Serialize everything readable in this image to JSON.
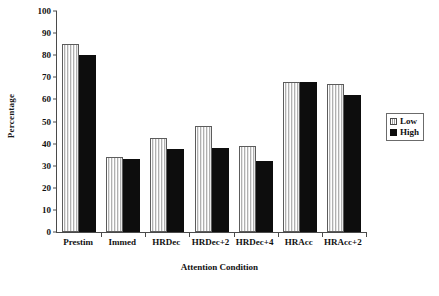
{
  "chart_data": {
    "type": "bar",
    "title": "",
    "xlabel": "Attention Condition",
    "ylabel": "Percentage",
    "categories": [
      "Prestim",
      "Immed",
      "HRDec",
      "HRDec+2",
      "HRDec+4",
      "HRAcc",
      "HRAcc+2"
    ],
    "series": [
      {
        "name": "Low",
        "values": [
          85,
          34,
          42.5,
          48,
          39,
          68,
          67
        ]
      },
      {
        "name": "High",
        "values": [
          80,
          33,
          37.5,
          38,
          32,
          68,
          62
        ]
      }
    ],
    "ylim": [
      0,
      100
    ],
    "yticks": [
      0,
      10,
      20,
      30,
      40,
      50,
      60,
      70,
      80,
      90,
      100
    ],
    "ytick_labels": [
      "0",
      "10",
      "20",
      "30",
      "40",
      "50",
      "60",
      "70",
      "80",
      "90",
      "100"
    ],
    "grid": false,
    "legend_position": "right",
    "legend_entries": [
      "Low",
      "High"
    ],
    "colors": {
      "low": "#c9c9c9",
      "high": "#0d0d0d",
      "axis": "#4a4a4a",
      "text": "#111111",
      "background": "#ffffff"
    }
  }
}
